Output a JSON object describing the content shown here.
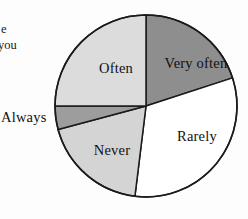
{
  "page": {
    "width": 248,
    "height": 219,
    "background": "#fdfdfd"
  },
  "surrounding_text": {
    "fragment_1": "e",
    "fragment_2": "you"
  },
  "chart_data": {
    "type": "pie",
    "title": "",
    "subtitle": "",
    "xlabel": "",
    "ylabel": "",
    "legend_position": "none",
    "grid": false,
    "labels_inside_slices": true,
    "center": {
      "cx": 146,
      "cy": 106
    },
    "radius": 91,
    "start_angle_deg": 0,
    "direction": "clockwise",
    "categories": [
      "Very often",
      "Rarely",
      "Never",
      "Always",
      "Often"
    ],
    "values": [
      20,
      32,
      19,
      4,
      25
    ],
    "units": "percent",
    "slices": [
      {
        "label": "Very often",
        "value": 20,
        "start_deg": 0,
        "end_deg": 72,
        "color": "#8e8e8e",
        "stroke": "#1a1a1a",
        "label_position": "inside",
        "label_x": 196,
        "label_y": 63
      },
      {
        "label": "Rarely",
        "value": 32,
        "start_deg": 72,
        "end_deg": 187,
        "color": "#ffffff",
        "stroke": "#1a1a1a",
        "label_position": "inside",
        "label_x": 197,
        "label_y": 136
      },
      {
        "label": "Never",
        "value": 19,
        "start_deg": 187,
        "end_deg": 255,
        "color": "#d4d4d4",
        "stroke": "#1a1a1a",
        "label_position": "inside",
        "label_x": 112,
        "label_y": 150
      },
      {
        "label": "Always",
        "value": 4,
        "start_deg": 255,
        "end_deg": 270,
        "color": "#9d9d9d",
        "stroke": "#1a1a1a",
        "label_position": "outside-left",
        "label_x": 28,
        "label_y": 118
      },
      {
        "label": "Often",
        "value": 25,
        "start_deg": 270,
        "end_deg": 360,
        "color": "#dcdcdc",
        "stroke": "#1a1a1a",
        "label_position": "inside",
        "label_x": 116,
        "label_y": 68
      }
    ],
    "colors": {
      "very_often": "#8e8e8e",
      "rarely": "#ffffff",
      "never": "#d4d4d4",
      "always": "#9d9d9d",
      "often": "#dcdcdc",
      "outline": "#1a1a1a",
      "text": "#111111"
    }
  }
}
